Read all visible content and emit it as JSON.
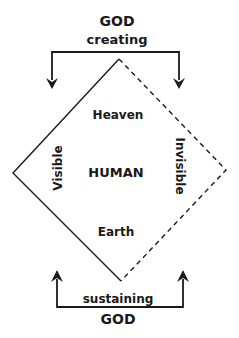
{
  "diagram": {
    "top": {
      "title": "GOD",
      "subtitle": "creating"
    },
    "bottom": {
      "subtitle": "sustaining",
      "title": "GOD"
    },
    "diamond": {
      "top_label": "Heaven",
      "center_label": "HUMAN",
      "bottom_label": "Earth",
      "left_label": "Visible",
      "right_label": "Invisible",
      "left_edges_style": "solid",
      "right_edges_style": "dashed"
    },
    "colors": {
      "line": "#1a1a1a",
      "text": "#1a1a1a",
      "background": "#ffffff"
    }
  }
}
